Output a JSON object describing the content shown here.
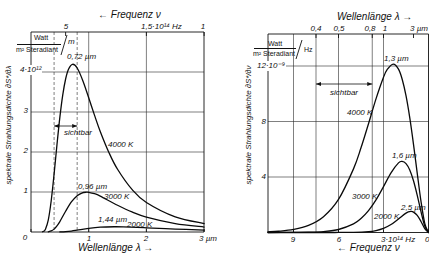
{
  "chart_data": [
    {
      "type": "line",
      "title": "",
      "xlabel": "Wellenlänge λ →",
      "ylabel": "spektrale Strahlungsdichte ∂S*/∂λ",
      "y_unit": {
        "numerator": "Watt",
        "denominator": "m² Steradiant",
        "per": "m"
      },
      "xlim": [
        0,
        3
      ],
      "ylim": [
        0,
        5
      ],
      "x_ticks": [
        {
          "value": 0,
          "label": "0"
        },
        {
          "value": 1,
          "label": "1"
        },
        {
          "value": 2,
          "label": "2"
        },
        {
          "value": 3,
          "label": "3 µm"
        }
      ],
      "y_ticks": [
        {
          "value": 1,
          "label": "1"
        },
        {
          "value": 2,
          "label": "2"
        },
        {
          "value": 3,
          "label": "3"
        },
        {
          "value": 4,
          "label": "4·10¹²"
        }
      ],
      "top_axis": {
        "label": "← Frequenz ν",
        "ticks": [
          {
            "pos": 0.6,
            "label": "5"
          },
          {
            "pos": 2,
            "label": "1,5·10¹⁴ Hz"
          },
          {
            "pos": 3,
            "label": "1"
          }
        ]
      },
      "grid": {
        "x": [
          1,
          2
        ],
        "y": [
          1,
          2,
          3,
          4
        ]
      },
      "visible_range": {
        "from": 0.4,
        "to": 0.8,
        "label": "sichtbar"
      },
      "legend": "none (curves labeled directly)",
      "series": [
        {
          "name": "4000 K",
          "peak": [
            0.72,
            4.19
          ],
          "peak_label": "0,72 µm",
          "points": [
            [
              0.2,
              0.006
            ],
            [
              0.22,
              0.018
            ],
            [
              0.25,
              0.069
            ],
            [
              0.3,
              0.304
            ],
            [
              0.35,
              0.781
            ],
            [
              0.4,
              1.447
            ],
            [
              0.45,
              2.181
            ],
            [
              0.5,
              2.864
            ],
            [
              0.55,
              3.423
            ],
            [
              0.6,
              3.825
            ],
            [
              0.65,
              4.07
            ],
            [
              0.72,
              4.193
            ],
            [
              0.8,
              4.1
            ],
            [
              0.9,
              3.777
            ],
            [
              1.0,
              3.356
            ],
            [
              1.1,
              2.922
            ],
            [
              1.2,
              2.514
            ],
            [
              1.35,
              1.989
            ],
            [
              1.5,
              1.568
            ],
            [
              1.75,
              1.065
            ],
            [
              2.0,
              0.739
            ],
            [
              2.5,
              0.379
            ],
            [
              3.0,
              0.212
            ]
          ]
        },
        {
          "name": "3000 K",
          "peak": [
            0.96,
            0.995
          ],
          "peak_label": "0,96 µm",
          "points": [
            [
              0.3,
              0.006
            ],
            [
              0.35,
              0.026
            ],
            [
              0.4,
              0.072
            ],
            [
              0.45,
              0.152
            ],
            [
              0.5,
              0.26
            ],
            [
              0.6,
              0.518
            ],
            [
              0.7,
              0.751
            ],
            [
              0.8,
              0.908
            ],
            [
              0.88,
              0.974
            ],
            [
              0.96,
              0.995
            ],
            [
              1.0,
              0.993
            ],
            [
              1.1,
              0.957
            ],
            [
              1.2,
              0.896
            ],
            [
              1.5,
              0.669
            ],
            [
              1.75,
              0.501
            ],
            [
              2.0,
              0.372
            ],
            [
              2.5,
              0.21
            ],
            [
              3.0,
              0.124
            ]
          ]
        },
        {
          "name": "2000 K",
          "peak": [
            1.44,
            0.131
          ],
          "peak_label": "1,44 µm",
          "points": [
            [
              0.5,
              0.002
            ],
            [
              0.6,
              0.01
            ],
            [
              0.7,
              0.024
            ],
            [
              0.8,
              0.045
            ],
            [
              1.0,
              0.09
            ],
            [
              1.2,
              0.12
            ],
            [
              1.44,
              0.131
            ],
            [
              1.6,
              0.128
            ],
            [
              2.0,
              0.105
            ],
            [
              2.5,
              0.073
            ],
            [
              3.0,
              0.049
            ]
          ]
        }
      ]
    },
    {
      "type": "line",
      "title": "",
      "xlabel": "← Frequenz ν",
      "ylabel": "spektrale Strahlungsdichte ∂S*/∂ν",
      "y_unit": {
        "numerator": "Watt",
        "denominator": "m² Steradiant",
        "per": "Hz"
      },
      "xlim": [
        10.7,
        0
      ],
      "ylim": [
        0,
        14.3
      ],
      "x_ticks": [
        {
          "value": 9,
          "label": "9"
        },
        {
          "value": 6,
          "label": "6"
        },
        {
          "value": 3,
          "label": "3·10¹⁴ Hz"
        },
        {
          "value": 0,
          "label": "0"
        }
      ],
      "y_ticks": [
        {
          "value": 4,
          "label": "4"
        },
        {
          "value": 8,
          "label": "8"
        },
        {
          "value": 12,
          "label": "12·10⁻⁹"
        }
      ],
      "top_axis": {
        "label": "Wellenlänge λ →",
        "ticks": [
          {
            "pos": 7.5,
            "label": "0,4"
          },
          {
            "pos": 6,
            "label": "0,5"
          },
          {
            "pos": 3.75,
            "label": "0,8"
          },
          {
            "pos": 3,
            "label": "1"
          },
          {
            "pos": 1,
            "label": "3 µm"
          }
        ]
      },
      "grid": {
        "x": [
          9,
          6,
          3
        ],
        "y": [
          4,
          8,
          12
        ]
      },
      "visible_range": {
        "from": 7.5,
        "to": 3.75,
        "label": "sichtbar"
      },
      "legend": "none (curves labeled directly)",
      "series": [
        {
          "name": "4000 K",
          "peak": [
            2.35,
            12.13
          ],
          "peak_label": "1,3 µm",
          "points": [
            [
              0,
              0
            ],
            [
              0.25,
              0.659
            ],
            [
              0.5,
              2.242
            ],
            [
              0.75,
              4.263
            ],
            [
              1,
              6.357
            ],
            [
              1.25,
              8.274
            ],
            [
              1.5,
              9.858
            ],
            [
              1.75,
              11.03
            ],
            [
              2,
              11.772
            ],
            [
              2.35,
              12.135
            ],
            [
              2.75,
              11.749
            ],
            [
              3,
              11.19
            ],
            [
              3.5,
              9.631
            ],
            [
              4,
              7.838
            ],
            [
              4.5,
              6.102
            ],
            [
              5,
              4.585
            ],
            [
              6,
              2.382
            ],
            [
              7,
              1.139
            ],
            [
              8,
              0.512
            ],
            [
              9,
              0.22
            ],
            [
              10,
              0.091
            ],
            [
              10.7,
              0.048
            ]
          ]
        },
        {
          "name": "3000 K",
          "peak": [
            1.76,
            5.12
          ],
          "peak_label": "1,6 µm",
          "points": [
            [
              0,
              0
            ],
            [
              0.25,
              0.469
            ],
            [
              0.5,
              1.504
            ],
            [
              0.75,
              2.682
            ],
            [
              1,
              3.732
            ],
            [
              1.25,
              4.509
            ],
            [
              1.5,
              4.966
            ],
            [
              1.76,
              5.12
            ],
            [
              2,
              5.015
            ],
            [
              2.5,
              4.302
            ],
            [
              3,
              3.307
            ],
            [
              3.5,
              2.349
            ],
            [
              4,
              1.573
            ],
            [
              4.5,
              1.005
            ],
            [
              5,
              0.619
            ],
            [
              6,
              0.216
            ],
            [
              7,
              0.069
            ],
            [
              8,
              0.021
            ],
            [
              9,
              0.006
            ],
            [
              10.7,
              0.0004
            ]
          ]
        },
        {
          "name": "2000 K",
          "peak": [
            1.18,
            1.517
          ],
          "peak_label": "2,5 µm",
          "points": [
            [
              0,
              0
            ],
            [
              0.25,
              0.28
            ],
            [
              0.5,
              0.795
            ],
            [
              0.75,
              1.232
            ],
            [
              1,
              1.472
            ],
            [
              1.18,
              1.517
            ],
            [
              1.5,
              1.399
            ],
            [
              2,
              0.98
            ],
            [
              2.5,
              0.573
            ],
            [
              3,
              0.298
            ],
            [
              3.5,
              0.142
            ],
            [
              4,
              0.064
            ],
            [
              5,
              0.011
            ],
            [
              6,
              0.002
            ],
            [
              7,
              0.0003
            ],
            [
              10.7,
              0
            ]
          ]
        }
      ]
    }
  ]
}
